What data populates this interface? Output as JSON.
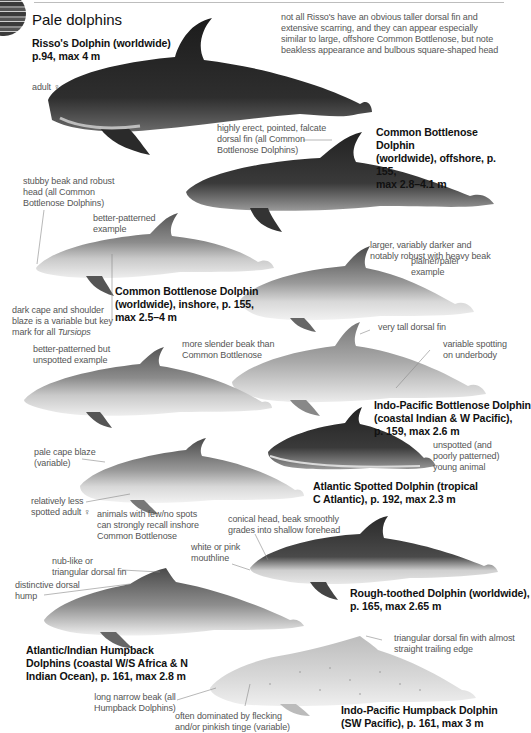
{
  "page": {
    "section_title": "Pale dolphins"
  },
  "species": [
    {
      "id": "rissos",
      "line1": "Risso's Dolphin (worldwide)",
      "line2": "p.94, max 4 m"
    },
    {
      "id": "common-bottlenose-offshore",
      "line1": "Common Bottlenose Dolphin",
      "line2": "(worldwide), offshore, p. 155,",
      "line3": "max 2.8–4.1 m"
    },
    {
      "id": "common-bottlenose-inshore",
      "line1": "Common Bottlenose Dolphin",
      "line2": "(worldwide), inshore, p. 155,",
      "line3": "max 2.5–4 m"
    },
    {
      "id": "indo-pacific-bottlenose",
      "line1": "Indo-Pacific Bottlenose Dolphin",
      "line2": "(coastal Indian & W Pacific),",
      "line3": "p. 159, max 2.6 m"
    },
    {
      "id": "atlantic-spotted",
      "line1": "Atlantic Spotted Dolphin (tropical",
      "line2": "C Atlantic), p. 192, max 2.3 m"
    },
    {
      "id": "rough-toothed",
      "line1": "Rough-toothed Dolphin (worldwide),",
      "line2": "p. 165, max 2.65 m"
    },
    {
      "id": "atlantic-indian-humpback",
      "line1": "Atlantic/Indian Humpback",
      "line2": "Dolphins (coastal W/S Africa & N",
      "line3": "Indian Ocean), p. 161, max 2.8 m"
    },
    {
      "id": "indo-pacific-humpback",
      "line1": "Indo-Pacific Humpback Dolphin",
      "line2": "(SW Pacific), p. 161, max 3 m"
    }
  ],
  "notes": {
    "rissos_adult": "adult ♀",
    "rissos_desc": [
      "not all Risso's have an obvious taller dorsal fin and",
      "extensive scarring, and they can appear especially",
      "similar to large, offshore Common Bottlenose, but note",
      "beakless appearance and bulbous square-shaped head"
    ],
    "falcate_fin": [
      "highly erect, pointed, falcate",
      "dorsal fin (all Common",
      "Bottlenose Dolphins)"
    ],
    "stubby_beak": [
      "stubby beak and robust",
      "head (all Common",
      "Bottlenose Dolphins)"
    ],
    "better_patterned": [
      "better-patterned",
      "example"
    ],
    "larger_darker": [
      "larger, variably darker and",
      "notably robust with heavy beak"
    ],
    "plainer_paler": [
      "plainer/paler",
      "example"
    ],
    "dark_cape": [
      "dark cape and shoulder",
      "blaze is a variable but key",
      "mark for all "
    ],
    "dark_cape_genus": "Tursiops",
    "very_tall_fin": "very tall dorsal fin",
    "better_unspotted": [
      "better-patterned but",
      "unspotted example"
    ],
    "slender_beak": [
      "more slender beak than",
      "Common Bottlenose"
    ],
    "variable_spotting": [
      "variable spotting",
      "on underbody"
    ],
    "unspotted_young": [
      "unspotted (and",
      "poorly patterned)",
      "young animal"
    ],
    "pale_cape": [
      "pale cape blaze",
      "(variable)"
    ],
    "less_spotted": [
      "relatively less",
      "spotted adult ♀"
    ],
    "few_spots": [
      "animals with few/no spots",
      "can strongly recall inshore",
      "Common Bottlenose"
    ],
    "conical_head": [
      "conical head, beak smoothly",
      "grades into shallow forehead"
    ],
    "mouthline": [
      "white or pink",
      "mouthline"
    ],
    "nub_fin": [
      "nub-like or",
      "triangular dorsal fin"
    ],
    "dorsal_hump": [
      "distinctive dorsal",
      "hump"
    ],
    "triangular_fin": [
      "triangular dorsal fin with almost",
      "straight trailing edge"
    ],
    "long_beak": [
      "long narrow beak (all",
      "Humpback Dolphins)"
    ],
    "flecking": [
      "often dominated by flecking",
      "and/or pinkish tinge (variable)"
    ]
  }
}
